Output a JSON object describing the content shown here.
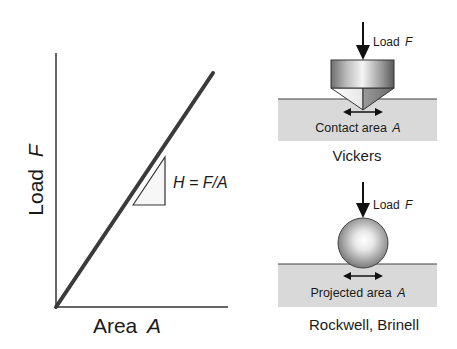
{
  "graph": {
    "y_axis_label": "Load",
    "y_axis_var": "F",
    "x_axis_label": "Area",
    "x_axis_var": "A",
    "slope_label": "H = F/A"
  },
  "vickers": {
    "load_label": "Load",
    "load_var": "F",
    "area_label": "Contact area",
    "area_var": "A",
    "title": "Vickers"
  },
  "rockwell": {
    "load_label": "Load",
    "load_var": "F",
    "area_label": "Projected area",
    "area_var": "A",
    "title": "Rockwell, Brinell"
  },
  "colors": {
    "line": "#3a3a3a",
    "axis": "#333333",
    "substrate": "#d9d9d9",
    "text": "#1a1a1a"
  }
}
